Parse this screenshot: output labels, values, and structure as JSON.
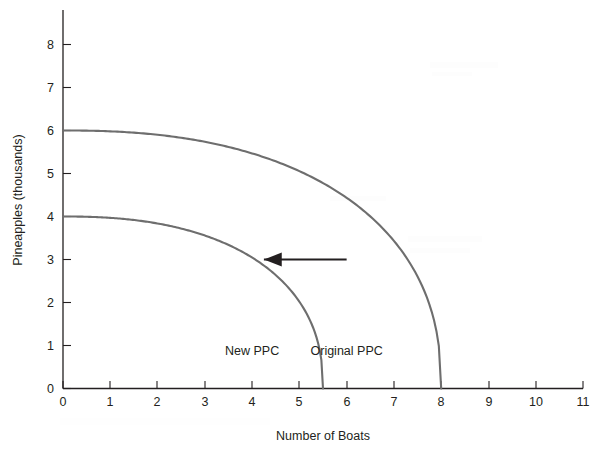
{
  "chart_data": {
    "type": "line",
    "title": "",
    "xlabel": "Number of Boats",
    "ylabel": "Pineapples (thousands)",
    "xlim": [
      0,
      11
    ],
    "ylim": [
      0,
      8
    ],
    "xticks": [
      "0",
      "1",
      "2",
      "3",
      "4",
      "5",
      "6",
      "7",
      "8",
      "9",
      "10",
      "11"
    ],
    "yticks": [
      "0",
      "1",
      "2",
      "3",
      "4",
      "5",
      "6",
      "7",
      "8"
    ],
    "grid": false,
    "legend_position": "inline-annotations",
    "series": [
      {
        "name": "Original PPC",
        "label": "Original PPC",
        "color": "#6e6e6e",
        "y_intercept": 6,
        "x_intercept": 8,
        "shape": "concave-quarter-ellipse",
        "points": [
          [
            0,
            6.0
          ],
          [
            1,
            5.9
          ],
          [
            2,
            5.7
          ],
          [
            3,
            5.4
          ],
          [
            4,
            4.9
          ],
          [
            5,
            4.3
          ],
          [
            6,
            3.5
          ],
          [
            7,
            2.4
          ],
          [
            7.5,
            1.7
          ],
          [
            8,
            0
          ]
        ]
      },
      {
        "name": "New PPC",
        "label": "New PPC",
        "color": "#6e6e6e",
        "y_intercept": 4,
        "x_intercept": 5.5,
        "shape": "concave-quarter-ellipse",
        "points": [
          [
            0,
            4.0
          ],
          [
            1,
            3.9
          ],
          [
            2,
            3.6
          ],
          [
            3,
            3.2
          ],
          [
            4,
            2.6
          ],
          [
            4.5,
            2.2
          ],
          [
            5,
            1.6
          ],
          [
            5.3,
            1.0
          ],
          [
            5.5,
            0
          ]
        ]
      }
    ],
    "annotations": [
      {
        "name": "shift-arrow",
        "type": "arrow",
        "direction": "left",
        "from": [
          6.0,
          3.0
        ],
        "to": [
          4.25,
          3.0
        ],
        "color": "#231f20",
        "meaning": "PPC shifts inward"
      },
      {
        "name": "new-ppc-label",
        "type": "text",
        "text": "New PPC",
        "at": [
          4.0,
          0.78
        ]
      },
      {
        "name": "original-ppc-label",
        "type": "text",
        "text": "Original PPC",
        "at": [
          6.0,
          0.78
        ]
      }
    ]
  }
}
